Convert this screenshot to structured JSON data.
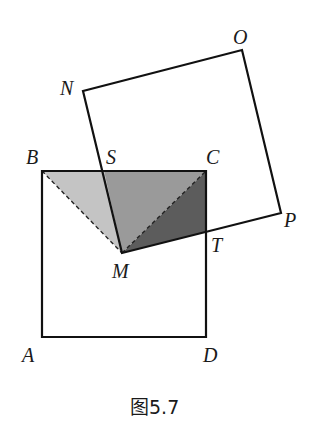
{
  "figure": {
    "caption": "图5.7",
    "colors": {
      "light_shade": "#c4c4c4",
      "mid_shade": "#9a9a9a",
      "dark_shade": "#5c5c5c",
      "stroke": "#111111"
    },
    "points": {
      "A": {
        "label": "A",
        "x": 42,
        "y": 337
      },
      "B": {
        "label": "B",
        "x": 42,
        "y": 171
      },
      "C": {
        "label": "C",
        "x": 206,
        "y": 171
      },
      "D": {
        "label": "D",
        "x": 206,
        "y": 337
      },
      "M": {
        "label": "M",
        "x": 122,
        "y": 253
      },
      "N": {
        "label": "N",
        "x": 83,
        "y": 91
      },
      "O": {
        "label": "O",
        "x": 242,
        "y": 50
      },
      "P": {
        "label": "P",
        "x": 281,
        "y": 213
      },
      "S": {
        "label": "S",
        "x": 104,
        "y": 171
      },
      "T": {
        "label": "T",
        "x": 206,
        "y": 232
      }
    },
    "shapes": {
      "square_ABCD": "Square ABCD",
      "square_MNOP": "Square MNOP (rotated about M)",
      "shaded_regions": [
        "Triangle BSM (light)",
        "Quadrilateral region SCM (medium)",
        "Triangle MCT (dark)"
      ],
      "dashed_segments": [
        "BM",
        "MC"
      ]
    }
  }
}
